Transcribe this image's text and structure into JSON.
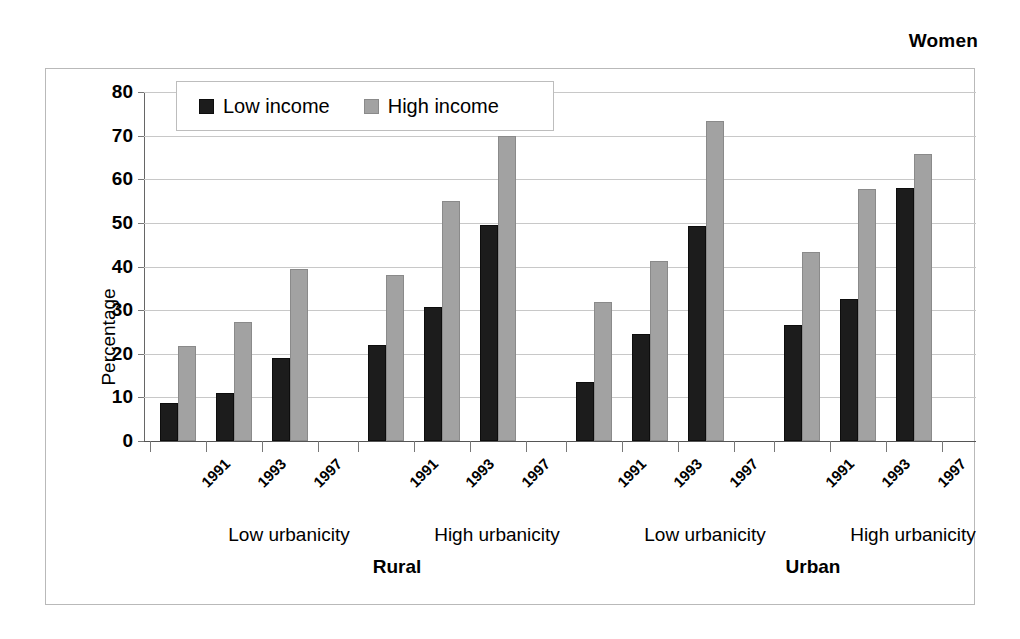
{
  "figure": {
    "title": "Women"
  },
  "legend": {
    "position": "top-left-inside",
    "items": [
      {
        "label": "Low income",
        "color": "#1c1c1c",
        "swatch": "low"
      },
      {
        "label": "High income",
        "color": "#a2a2a2",
        "swatch": "high"
      }
    ]
  },
  "axes": {
    "ylabel": "Percentage",
    "yticks": [
      0,
      10,
      20,
      30,
      40,
      50,
      60,
      70,
      80
    ],
    "ylim": [
      0,
      80
    ],
    "grid": true
  },
  "group_labels": {
    "urbanicity": [
      "Low urbanicity",
      "High urbanicity",
      "Low urbanicity",
      "High urbanicity"
    ],
    "area": [
      "Rural",
      "Urban"
    ]
  },
  "chart_data": {
    "type": "bar",
    "title": "Women",
    "xlabel": "",
    "ylabel": "Percentage",
    "ylim": [
      0,
      80
    ],
    "yticks": [
      0,
      10,
      20,
      30,
      40,
      50,
      60,
      70,
      80
    ],
    "grid": true,
    "legend_position": "top-left-inside",
    "categories": [
      "1991",
      "1993",
      "1997",
      "1991",
      "1993",
      "1997",
      "1991",
      "1993",
      "1997",
      "1991",
      "1993",
      "1997"
    ],
    "groups": [
      {
        "area": "Rural",
        "urbanicity": "Low urbanicity",
        "years": [
          "1991",
          "1993",
          "1997"
        ],
        "low_income": [
          8.8,
          11.0,
          19.0
        ],
        "high_income": [
          21.8,
          27.3,
          39.5
        ]
      },
      {
        "area": "Rural",
        "urbanicity": "High urbanicity",
        "years": [
          "1991",
          "1993",
          "1997"
        ],
        "low_income": [
          22.0,
          30.8,
          49.5
        ],
        "high_income": [
          38.0,
          55.0,
          70.0
        ]
      },
      {
        "area": "Urban",
        "urbanicity": "Low urbanicity",
        "years": [
          "1991",
          "1993",
          "1997"
        ],
        "low_income": [
          13.6,
          24.5,
          49.3
        ],
        "high_income": [
          31.8,
          41.3,
          73.3
        ]
      },
      {
        "area": "Urban",
        "urbanicity": "High urbanicity",
        "years": [
          "1991",
          "1993",
          "1997"
        ],
        "low_income": [
          26.5,
          32.5,
          58.0
        ],
        "high_income": [
          43.3,
          57.7,
          65.8
        ]
      }
    ],
    "series": [
      {
        "name": "Low income",
        "color": "#1c1c1c",
        "values": [
          8.8,
          11.0,
          19.0,
          22.0,
          30.8,
          49.5,
          13.6,
          24.5,
          49.3,
          26.5,
          32.5,
          58.0
        ]
      },
      {
        "name": "High income",
        "color": "#a2a2a2",
        "values": [
          21.8,
          27.3,
          39.5,
          38.0,
          55.0,
          70.0,
          31.8,
          41.3,
          73.3,
          43.3,
          57.7,
          65.8
        ]
      }
    ]
  }
}
